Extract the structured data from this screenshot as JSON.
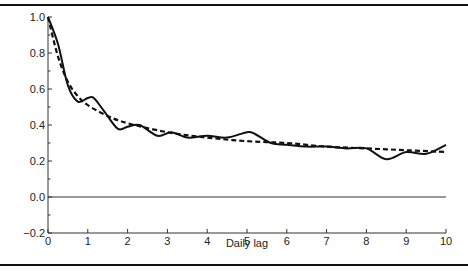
{
  "chart_data": {
    "type": "line",
    "title": "",
    "xlabel": "Daily lag",
    "ylabel": "",
    "xlim": [
      0,
      10
    ],
    "ylim": [
      -0.2,
      1.0
    ],
    "grid": false,
    "legend": null,
    "x_ticks": [
      "0",
      "1",
      "2",
      "3",
      "4",
      "5",
      "6",
      "7",
      "8",
      "9",
      "10"
    ],
    "y_ticks": [
      "1.0",
      "0.8",
      "0.6",
      "0.4",
      "0.2",
      "0.0",
      "−0.2"
    ],
    "reference_line": {
      "y": 0.0,
      "style": "thin solid"
    },
    "series": [
      {
        "name": "Autocorrelation (observed)",
        "style": "solid",
        "x": [
          0,
          0.25,
          0.5,
          0.75,
          1.0,
          1.15,
          1.4,
          1.75,
          2.0,
          2.3,
          2.75,
          3.1,
          3.5,
          4.0,
          4.5,
          5.0,
          5.2,
          5.6,
          6.0,
          6.5,
          7.0,
          7.5,
          8.0,
          8.5,
          9.0,
          9.5,
          10.0
        ],
        "values": [
          1.0,
          0.85,
          0.62,
          0.53,
          0.55,
          0.55,
          0.48,
          0.38,
          0.39,
          0.4,
          0.34,
          0.36,
          0.33,
          0.34,
          0.33,
          0.36,
          0.35,
          0.3,
          0.29,
          0.28,
          0.28,
          0.27,
          0.27,
          0.21,
          0.25,
          0.24,
          0.29
        ]
      },
      {
        "name": "Fitted decay",
        "style": "dashed",
        "x": [
          0,
          0.25,
          0.5,
          0.75,
          1.0,
          1.5,
          2.0,
          3.0,
          4.0,
          5.0,
          6.0,
          7.0,
          8.0,
          9.0,
          10.0
        ],
        "values": [
          1.0,
          0.78,
          0.64,
          0.56,
          0.51,
          0.45,
          0.41,
          0.36,
          0.33,
          0.31,
          0.3,
          0.28,
          0.27,
          0.26,
          0.25
        ]
      }
    ]
  },
  "layout": {
    "plot": {
      "x0": 48,
      "x1": 446,
      "y_top_value": 1.0,
      "y_top_px": 17,
      "y_zero_px": 197,
      "px_per_unit_y": 180
    },
    "colors": {
      "line": "#111111",
      "axis": "#333333",
      "frame": "#111111"
    }
  }
}
